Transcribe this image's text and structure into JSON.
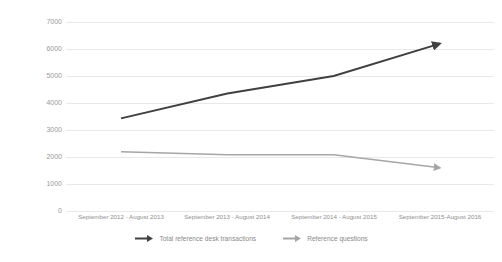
{
  "chart_data": {
    "type": "line",
    "title": "",
    "xlabel": "",
    "ylabel": "Total Number of Transactions and Reference Questions",
    "categories": [
      "September 2012 - August 2013",
      "September 2013 - August 2014",
      "September 2014 - August 2015",
      "September 2015-August 2016"
    ],
    "series": [
      {
        "name": "Total reference desk transactions",
        "values": [
          3430,
          4350,
          5000,
          6200
        ],
        "color": "#404040"
      },
      {
        "name": "Reference questions",
        "values": [
          2190,
          2080,
          2080,
          1600
        ],
        "color": "#a6a6a6"
      }
    ],
    "ylim": [
      0,
      7000
    ],
    "ytick_labels": [
      "7000",
      "6000",
      "5000",
      "4000",
      "3000",
      "2000",
      "1000",
      "0"
    ],
    "ytick_values": [
      7000,
      6000,
      5000,
      4000,
      3000,
      2000,
      1000,
      0
    ],
    "grid": "horizontal",
    "legend_position": "bottom",
    "marker": "arrow-end"
  },
  "legend": {
    "items": [
      {
        "label": "Total reference desk transactions",
        "icon": "arrow-right-icon"
      },
      {
        "label": "Reference questions",
        "icon": "arrow-right-icon"
      }
    ]
  },
  "colors": {
    "series_dark": "#404040",
    "series_light": "#a6a6a6",
    "gridline": "#e8e8e8",
    "text": "#8a8a8a",
    "background": "#ffffff"
  }
}
